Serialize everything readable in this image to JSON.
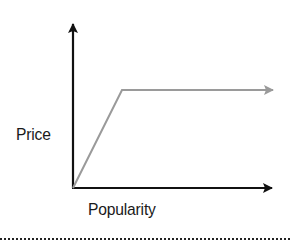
{
  "diagram": {
    "type": "line-sketch",
    "y_axis_label": "Price",
    "x_axis_label": "Popularity",
    "colors": {
      "axes": "#111111",
      "line": "#9a9a9a",
      "text": "#1a1a1a",
      "divider": "#222222"
    },
    "geometry": {
      "origin": [
        73,
        188
      ],
      "y_axis_top": [
        73,
        22
      ],
      "x_axis_end": [
        274,
        188
      ],
      "line_points": [
        [
          73,
          188
        ],
        [
          122,
          90
        ],
        [
          273,
          90
        ]
      ]
    }
  }
}
